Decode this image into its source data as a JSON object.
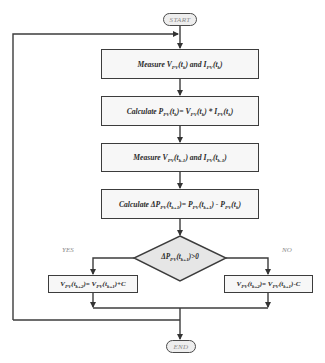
{
  "flowchart": {
    "start_label": "START",
    "end_label": "END",
    "steps": [
      {
        "id": "measure-current",
        "pre": "Measure ",
        "parts": [
          [
            "V",
            "PV",
            "(t",
            "k",
            ")"
          ],
          [
            " and "
          ],
          [
            "I",
            "PV",
            "(t",
            "k",
            ")"
          ]
        ],
        "text": "Measure V_PV(t_k) and I_PV(t_k)"
      },
      {
        "id": "calc-power",
        "text": "Calculate P_PV(t_k)= V_PV(t_k) * I_PV(t_k)"
      },
      {
        "id": "measure-next",
        "text": "Measure V_PV(t_k-1) and I_PV(t_k-1)"
      },
      {
        "id": "calc-delta",
        "text": "Calculate ΔP_PV(t_k+1)= P_PV(t_k+1) - P_PV(t_k)"
      }
    ],
    "decision": {
      "text": "ΔP_PV(t_k+1)>0",
      "yes_label": "YES",
      "no_label": "NO"
    },
    "yes_action": "V_PV(t_k+2)= V_PV(t_k+1)+C",
    "no_action": "V_PV(t_k+2)= V_PV(t_k+1)-C"
  },
  "text": {
    "start": "START",
    "end": "END",
    "yes": "YES",
    "no": "NO",
    "s1_a": "Measure V",
    "s1_b": "PV",
    "s1_c": "(t",
    "s1_d": "k",
    "s1_e": ") and I",
    "s1_f": "PV",
    "s1_g": "(t",
    "s1_h": "k",
    "s1_i": ")",
    "s2_a": "Calculate P",
    "s2_b": "PV",
    "s2_c": "(t",
    "s2_d": "k",
    "s2_e": ")= V",
    "s2_f": "PV",
    "s2_g": "(t",
    "s2_h": "k",
    "s2_i": ") * I",
    "s2_j": "PV",
    "s2_k": "(t",
    "s2_l": "k",
    "s2_m": ")",
    "s3_a": "Measure V",
    "s3_b": "PV",
    "s3_c": "(t",
    "s3_d": "k-1",
    "s3_e": ") and I",
    "s3_f": "PV",
    "s3_g": "(t",
    "s3_h": "k-1",
    "s3_i": ")",
    "s4_a": "Calculate ΔP",
    "s4_b": "PV",
    "s4_c": "(t",
    "s4_d": "k+1",
    "s4_e": ")= P",
    "s4_f": "PV",
    "s4_g": "(t",
    "s4_h": "k+1",
    "s4_i": ") - P",
    "s4_j": "PV",
    "s4_k": "(t",
    "s4_l": "k",
    "s4_m": ")",
    "d_a": "ΔP",
    "d_b": "PV",
    "d_c": "(t",
    "d_d": "k+1",
    "d_e": ")>0",
    "y_a": "V",
    "y_b": "PV",
    "y_c": "(t",
    "y_d": "k+2",
    "y_e": ")= V",
    "y_f": "PV",
    "y_g": "(t",
    "y_h": "k+1",
    "y_i": ")+C",
    "n_a": "V",
    "n_b": "PV",
    "n_c": "(t",
    "n_d": "k+2",
    "n_e": ")= V",
    "n_f": "PV",
    "n_g": "(t",
    "n_h": "k+1",
    "n_i": ")-C"
  },
  "colors": {
    "stroke": "#3c3c3c",
    "box_fill": "#f7f7f7",
    "diamond_fill": "#e6e6e6",
    "terminal_text": "#8a8a8a"
  }
}
